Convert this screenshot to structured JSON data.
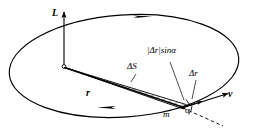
{
  "figure": {
    "kind": "physics-vector-diagram",
    "background_color": "#ffffff",
    "stroke_color": "#000000",
    "width": 254,
    "height": 135,
    "labels": {
      "angular_momentum": "L",
      "radius_vector": "r",
      "swept_area": "ΔS",
      "displacement": "Δr",
      "perpendicular_component": "|Δr|sinα",
      "velocity": "v",
      "mass": "m",
      "angle": "α"
    },
    "elements": [
      {
        "name": "orbit-ellipse",
        "type": "ellipse",
        "description": "elliptical orbital path drawn in perspective"
      },
      {
        "name": "orbit-direction-arrow-top",
        "type": "arrowhead",
        "description": "direction of motion marker on upper arc"
      },
      {
        "name": "orbit-direction-arrow-bottom",
        "type": "arrowhead",
        "description": "direction of motion marker on lower arc"
      },
      {
        "name": "angular-momentum-axis",
        "type": "vector",
        "description": "vertical arrow labelled L through orbit center"
      },
      {
        "name": "center-point",
        "type": "open-circle",
        "description": "center of orbit"
      },
      {
        "name": "radius-vector",
        "type": "vector",
        "description": "vector r from center to particle m"
      },
      {
        "name": "swept-area-triangle",
        "type": "hatched-polygon",
        "description": "hatched sliver of area ΔS swept by r"
      },
      {
        "name": "displacement-vector",
        "type": "vector",
        "description": "small displacement vector Δr at the particle"
      },
      {
        "name": "perpendicular-leader",
        "type": "leader-line",
        "description": "leader to |Δr|sinα segment"
      },
      {
        "name": "velocity-vector",
        "type": "vector",
        "description": "velocity vector v tangent to orbit"
      },
      {
        "name": "tangent-dashed-line",
        "type": "dashed-line",
        "description": "dashed extension of radius line past m"
      },
      {
        "name": "angle-arc",
        "type": "arc",
        "description": "arc marking angle α between r extension and v"
      }
    ]
  }
}
